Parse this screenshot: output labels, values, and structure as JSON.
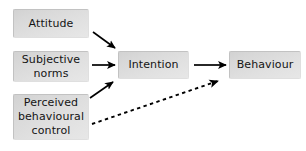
{
  "diagram": {
    "background_color": "#ffffff",
    "node_fill_color": "#dcdcdc",
    "edge_color": "#000000",
    "nodes": [
      {
        "id": "attitude",
        "label": "Attitude"
      },
      {
        "id": "subjective",
        "label": "Subjective\nnorms"
      },
      {
        "id": "perceived",
        "label": "Perceived\nbehavioural\ncontrol"
      },
      {
        "id": "intention",
        "label": "Intention"
      },
      {
        "id": "behaviour",
        "label": "Behaviour"
      }
    ],
    "edges": [
      {
        "id": "attitude-to-intention",
        "from": "attitude",
        "to": "intention",
        "style": "solid",
        "label": ""
      },
      {
        "id": "subjective-to-intention",
        "from": "subjective",
        "to": "intention",
        "style": "solid",
        "label": ""
      },
      {
        "id": "perceived-to-intention",
        "from": "perceived",
        "to": "intention",
        "style": "solid",
        "label": ""
      },
      {
        "id": "intention-to-behaviour",
        "from": "intention",
        "to": "behaviour",
        "style": "solid",
        "label": ""
      },
      {
        "id": "perceived-to-behaviour",
        "from": "perceived",
        "to": "behaviour",
        "style": "dashed",
        "label": ""
      }
    ]
  }
}
